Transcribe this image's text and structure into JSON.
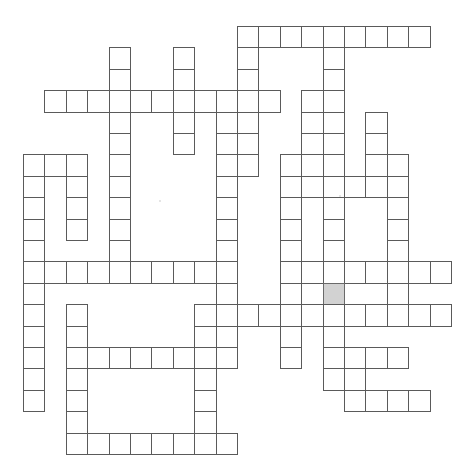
{
  "puzzle": {
    "title": "Crossword Puzzle Grid",
    "type": "crossword-grid",
    "grid": {
      "columns": 20,
      "rows": 21,
      "cell_size": 21.4,
      "origin_x": 23,
      "origin_y": 26,
      "line_color": "#5a5a5a",
      "cell_color": "#ffffff",
      "shaded_color": "#d2d2d2"
    },
    "shaded_cells": [
      [
        14,
        12
      ]
    ],
    "entries": [
      {
        "name": "across-r0-c10",
        "direction": "across",
        "row": 0,
        "col": 10,
        "length": 9
      },
      {
        "name": "down-r0-c10",
        "direction": "down",
        "row": 0,
        "col": 10,
        "length": 10
      },
      {
        "name": "down-r1-c4",
        "direction": "down",
        "row": 1,
        "col": 4,
        "length": 3
      },
      {
        "name": "down-r0-c5",
        "direction": "down",
        "row": 0,
        "col": 5,
        "length": 8
      },
      {
        "name": "down-r1-c7",
        "direction": "down",
        "row": 1,
        "col": 7,
        "length": 4
      },
      {
        "name": "down-r0-c14",
        "direction": "down",
        "row": 0,
        "col": 14,
        "length": 13
      },
      {
        "name": "across-r3-c1",
        "direction": "across",
        "row": 3,
        "col": 1,
        "length": 11
      },
      {
        "name": "down-r3-c9",
        "direction": "down",
        "row": 3,
        "col": 9,
        "length": 13
      },
      {
        "name": "down-r3-c13",
        "direction": "down",
        "row": 3,
        "col": 13,
        "length": 3
      },
      {
        "name": "down-r4-c16",
        "direction": "down",
        "row": 4,
        "col": 16,
        "length": 2
      },
      {
        "name": "across-r6-c0",
        "direction": "across",
        "row": 6,
        "col": 0,
        "length": 3
      },
      {
        "name": "down-r6-c0",
        "direction": "down",
        "row": 6,
        "col": 0,
        "length": 13
      },
      {
        "name": "down-r6-c2",
        "direction": "down",
        "row": 6,
        "col": 2,
        "length": 4
      },
      {
        "name": "down-r6-c12",
        "direction": "down",
        "row": 6,
        "col": 12,
        "length": 7
      },
      {
        "name": "down-r6-c17",
        "direction": "down",
        "row": 6,
        "col": 17,
        "length": 7
      },
      {
        "name": "across-r7-c12",
        "direction": "across",
        "row": 7,
        "col": 12,
        "length": 6
      },
      {
        "name": "down-r8-c4",
        "direction": "down",
        "row": 8,
        "col": 4,
        "length": 3
      },
      {
        "name": "across-r11-c0",
        "direction": "across",
        "row": 11,
        "col": 0,
        "length": 10
      },
      {
        "name": "across-r11-c13",
        "direction": "across",
        "row": 11,
        "col": 13,
        "length": 7
      },
      {
        "name": "across-r13-c8",
        "direction": "across",
        "row": 13,
        "col": 8,
        "length": 12
      },
      {
        "name": "down-r13-c8",
        "direction": "down",
        "row": 13,
        "col": 8,
        "length": 5
      },
      {
        "name": "across-r15-c2",
        "direction": "across",
        "row": 15,
        "col": 2,
        "length": 8
      },
      {
        "name": "down-r15-c15",
        "direction": "down",
        "row": 15,
        "col": 15,
        "length": 3
      },
      {
        "name": "across-r17-c15",
        "direction": "across",
        "row": 17,
        "col": 15,
        "length": 4
      },
      {
        "name": "across-r19-c2",
        "direction": "across",
        "row": 19,
        "col": 2,
        "length": 8
      }
    ],
    "cells": [
      [
        10,
        0
      ],
      [
        11,
        0
      ],
      [
        12,
        0
      ],
      [
        13,
        0
      ],
      [
        14,
        0
      ],
      [
        15,
        0
      ],
      [
        16,
        0
      ],
      [
        17,
        0
      ],
      [
        18,
        0
      ],
      [
        4,
        1
      ],
      [
        7,
        1
      ],
      [
        10,
        1
      ],
      [
        14,
        1
      ],
      [
        4,
        2
      ],
      [
        7,
        2
      ],
      [
        10,
        2
      ],
      [
        14,
        2
      ],
      [
        1,
        3
      ],
      [
        2,
        3
      ],
      [
        3,
        3
      ],
      [
        4,
        3
      ],
      [
        5,
        3
      ],
      [
        6,
        3
      ],
      [
        7,
        3
      ],
      [
        8,
        3
      ],
      [
        9,
        3
      ],
      [
        10,
        3
      ],
      [
        11,
        3
      ],
      [
        13,
        3
      ],
      [
        14,
        3
      ],
      [
        4,
        4
      ],
      [
        7,
        4
      ],
      [
        9,
        4
      ],
      [
        10,
        4
      ],
      [
        13,
        4
      ],
      [
        14,
        4
      ],
      [
        16,
        4
      ],
      [
        4,
        5
      ],
      [
        7,
        5
      ],
      [
        9,
        5
      ],
      [
        10,
        5
      ],
      [
        13,
        5
      ],
      [
        14,
        5
      ],
      [
        16,
        5
      ],
      [
        0,
        6
      ],
      [
        1,
        6
      ],
      [
        2,
        6
      ],
      [
        4,
        6
      ],
      [
        9,
        6
      ],
      [
        10,
        6
      ],
      [
        12,
        6
      ],
      [
        13,
        6
      ],
      [
        14,
        6
      ],
      [
        16,
        6
      ],
      [
        17,
        6
      ],
      [
        0,
        7
      ],
      [
        2,
        7
      ],
      [
        4,
        7
      ],
      [
        9,
        7
      ],
      [
        12,
        7
      ],
      [
        13,
        7
      ],
      [
        14,
        7
      ],
      [
        15,
        7
      ],
      [
        16,
        7
      ],
      [
        17,
        7
      ],
      [
        0,
        8
      ],
      [
        2,
        8
      ],
      [
        4,
        8
      ],
      [
        9,
        8
      ],
      [
        12,
        8
      ],
      [
        14,
        8
      ],
      [
        17,
        8
      ],
      [
        0,
        9
      ],
      [
        2,
        9
      ],
      [
        4,
        9
      ],
      [
        9,
        9
      ],
      [
        12,
        9
      ],
      [
        14,
        9
      ],
      [
        17,
        9
      ],
      [
        0,
        10
      ],
      [
        4,
        10
      ],
      [
        9,
        10
      ],
      [
        12,
        10
      ],
      [
        14,
        10
      ],
      [
        17,
        10
      ],
      [
        0,
        11
      ],
      [
        1,
        11
      ],
      [
        2,
        11
      ],
      [
        3,
        11
      ],
      [
        4,
        11
      ],
      [
        5,
        11
      ],
      [
        6,
        11
      ],
      [
        7,
        11
      ],
      [
        8,
        11
      ],
      [
        9,
        11
      ],
      [
        12,
        11
      ],
      [
        13,
        11
      ],
      [
        14,
        11
      ],
      [
        15,
        11
      ],
      [
        16,
        11
      ],
      [
        17,
        11
      ],
      [
        18,
        11
      ],
      [
        19,
        11
      ],
      [
        0,
        12
      ],
      [
        9,
        12
      ],
      [
        12,
        12
      ],
      [
        14,
        12
      ],
      [
        17,
        12
      ],
      [
        0,
        13
      ],
      [
        2,
        13
      ],
      [
        8,
        13
      ],
      [
        9,
        13
      ],
      [
        10,
        13
      ],
      [
        11,
        13
      ],
      [
        12,
        13
      ],
      [
        13,
        13
      ],
      [
        14,
        13
      ],
      [
        15,
        13
      ],
      [
        16,
        13
      ],
      [
        17,
        13
      ],
      [
        18,
        13
      ],
      [
        19,
        13
      ],
      [
        0,
        14
      ],
      [
        2,
        14
      ],
      [
        8,
        14
      ],
      [
        9,
        14
      ],
      [
        12,
        14
      ],
      [
        14,
        14
      ],
      [
        0,
        15
      ],
      [
        2,
        15
      ],
      [
        3,
        15
      ],
      [
        4,
        15
      ],
      [
        5,
        15
      ],
      [
        6,
        15
      ],
      [
        7,
        15
      ],
      [
        8,
        15
      ],
      [
        9,
        15
      ],
      [
        12,
        15
      ],
      [
        14,
        15
      ],
      [
        15,
        15
      ],
      [
        16,
        15
      ],
      [
        17,
        15
      ],
      [
        0,
        16
      ],
      [
        2,
        16
      ],
      [
        8,
        16
      ],
      [
        14,
        16
      ],
      [
        15,
        16
      ],
      [
        0,
        17
      ],
      [
        2,
        17
      ],
      [
        8,
        17
      ],
      [
        15,
        17
      ],
      [
        16,
        17
      ],
      [
        17,
        17
      ],
      [
        18,
        17
      ],
      [
        2,
        18
      ],
      [
        8,
        18
      ],
      [
        2,
        19
      ],
      [
        3,
        19
      ],
      [
        4,
        19
      ],
      [
        5,
        19
      ],
      [
        6,
        19
      ],
      [
        7,
        19
      ],
      [
        8,
        19
      ],
      [
        9,
        19
      ]
    ],
    "artifacts": [
      {
        "name": "dust-speck",
        "x": 159,
        "y": 200
      },
      {
        "name": "dust-speck",
        "x": 339,
        "y": 195
      }
    ]
  }
}
